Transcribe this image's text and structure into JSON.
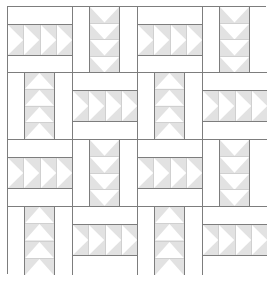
{
  "diagram": {
    "type": "quilt-pattern",
    "grid": {
      "rows": 4,
      "columns": 4
    },
    "colors": {
      "background": "#ffffff",
      "geese_fill": "#e2e2e2",
      "goose_triangle": "#ffffff",
      "seam_lines": "#7d7d7d"
    },
    "geese_per_block": 4,
    "blocks": [
      [
        {
          "orientation": "horizontal",
          "geese_direction": "right"
        },
        {
          "orientation": "vertical",
          "geese_direction": "down"
        },
        {
          "orientation": "horizontal",
          "geese_direction": "right"
        },
        {
          "orientation": "vertical",
          "geese_direction": "down"
        }
      ],
      [
        {
          "orientation": "vertical",
          "geese_direction": "up"
        },
        {
          "orientation": "horizontal",
          "geese_direction": "right"
        },
        {
          "orientation": "vertical",
          "geese_direction": "up"
        },
        {
          "orientation": "horizontal",
          "geese_direction": "right"
        }
      ],
      [
        {
          "orientation": "horizontal",
          "geese_direction": "right"
        },
        {
          "orientation": "vertical",
          "geese_direction": "down"
        },
        {
          "orientation": "horizontal",
          "geese_direction": "right"
        },
        {
          "orientation": "vertical",
          "geese_direction": "down"
        }
      ],
      [
        {
          "orientation": "vertical",
          "geese_direction": "up"
        },
        {
          "orientation": "horizontal",
          "geese_direction": "right"
        },
        {
          "orientation": "vertical",
          "geese_direction": "up"
        },
        {
          "orientation": "horizontal",
          "geese_direction": "right"
        }
      ]
    ]
  }
}
